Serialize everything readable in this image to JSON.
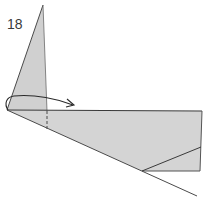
{
  "diagram": {
    "step_number": "18",
    "colors": {
      "paper_fill": "#d4d4d4",
      "line": "#4a4a4a",
      "background": "#ffffff"
    },
    "elements": [
      {
        "name": "vertical-flap",
        "kind": "shaded triangle"
      },
      {
        "name": "horizontal-panel",
        "kind": "shaded quadrilateral"
      },
      {
        "name": "fold-line-dashed",
        "kind": "valley fold line"
      },
      {
        "name": "curved-arrow",
        "kind": "fold direction arrow"
      },
      {
        "name": "diagonal-crease",
        "kind": "crease line"
      },
      {
        "name": "base-edge-line",
        "kind": "paper edge"
      }
    ]
  }
}
